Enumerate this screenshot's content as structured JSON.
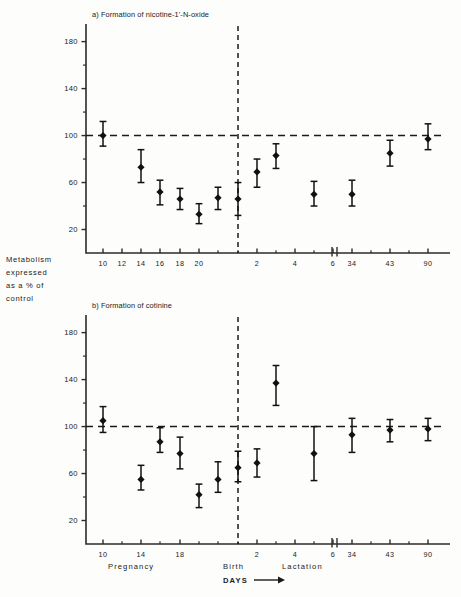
{
  "figure": {
    "y_axis_label_lines": [
      "Metabolism",
      "expressed",
      "as  a % of",
      "control"
    ],
    "y_axis_label_text": "Metabolism expressed as a % of control",
    "phase_labels": {
      "pregnancy": "Pregnancy",
      "birth": "Birth",
      "lactation": "Lactation",
      "days": "DAYS",
      "arrow": "⟶"
    },
    "colors": {
      "ink": "#1a1a1a",
      "marker": "#111111",
      "axis": "#2b2b2b",
      "background": "#fdfdfb"
    }
  },
  "chart_data": [
    {
      "type": "scatter",
      "panel": "a",
      "title": "a) Formation of nicotine-1'-N-oxide",
      "xlabel": "DAYS",
      "ylabel": "Metabolism expressed as a % of control",
      "ylim": [
        0,
        195
      ],
      "yticks": [
        20,
        60,
        100,
        140,
        180
      ],
      "yticks_minor": [
        40,
        80,
        120,
        160
      ],
      "grid": false,
      "reference_line": 100,
      "birth_marker": "Birth",
      "axis_break": true,
      "xticks": [
        "10",
        "12",
        "14",
        "16",
        "18",
        "20",
        "2",
        "4",
        "6",
        "34",
        "43",
        "90"
      ],
      "error_type": "range",
      "points": [
        {
          "label": "10",
          "phase": "pregnancy",
          "value": 100,
          "low": 91,
          "high": 112
        },
        {
          "label": "14",
          "phase": "pregnancy",
          "value": 73,
          "low": 60,
          "high": 88
        },
        {
          "label": "16",
          "phase": "pregnancy",
          "value": 52,
          "low": 41,
          "high": 62
        },
        {
          "label": "18",
          "phase": "pregnancy",
          "value": 46,
          "low": 37,
          "high": 55
        },
        {
          "label": "20",
          "phase": "pregnancy",
          "value": 33,
          "low": 25,
          "high": 42
        },
        {
          "label": "21",
          "phase": "pregnancy",
          "value": 47,
          "low": 37,
          "high": 56
        },
        {
          "label": "1",
          "phase": "lactation",
          "value": 46,
          "low": 32,
          "high": 60
        },
        {
          "label": "2",
          "phase": "lactation",
          "value": 69,
          "low": 56,
          "high": 80
        },
        {
          "label": "3",
          "phase": "lactation",
          "value": 83,
          "low": 72,
          "high": 93
        },
        {
          "label": "5",
          "phase": "lactation",
          "value": 50,
          "low": 40,
          "high": 61
        },
        {
          "label": "34",
          "phase": "lactation",
          "value": 50,
          "low": 40,
          "high": 62
        },
        {
          "label": "43",
          "phase": "lactation",
          "value": 85,
          "low": 74,
          "high": 96
        },
        {
          "label": "90",
          "phase": "lactation",
          "value": 97,
          "low": 88,
          "high": 110
        }
      ]
    },
    {
      "type": "scatter",
      "panel": "b",
      "title": "b) Formation of cotinine",
      "xlabel": "DAYS",
      "ylabel": "Metabolism expressed as a % of control",
      "ylim": [
        0,
        195
      ],
      "yticks": [
        20,
        60,
        100,
        140,
        180
      ],
      "yticks_minor": [
        40,
        80,
        120,
        160
      ],
      "grid": false,
      "reference_line": 100,
      "birth_marker": "Birth",
      "axis_break": true,
      "xticks": [
        "10",
        "14",
        "18",
        "2",
        "4",
        "6",
        "34",
        "43",
        "90"
      ],
      "error_type": "range",
      "points": [
        {
          "label": "10",
          "phase": "pregnancy",
          "value": 105,
          "low": 95,
          "high": 117
        },
        {
          "label": "14",
          "phase": "pregnancy",
          "value": 55,
          "low": 46,
          "high": 67
        },
        {
          "label": "16",
          "phase": "pregnancy",
          "value": 87,
          "low": 78,
          "high": 99
        },
        {
          "label": "18",
          "phase": "pregnancy",
          "value": 77,
          "low": 64,
          "high": 91
        },
        {
          "label": "20",
          "phase": "pregnancy",
          "value": 42,
          "low": 31,
          "high": 51
        },
        {
          "label": "21",
          "phase": "pregnancy",
          "value": 55,
          "low": 44,
          "high": 70
        },
        {
          "label": "1",
          "phase": "lactation",
          "value": 65,
          "low": 53,
          "high": 79
        },
        {
          "label": "2",
          "phase": "lactation",
          "value": 69,
          "low": 57,
          "high": 81
        },
        {
          "label": "3",
          "phase": "lactation",
          "value": 137,
          "low": 118,
          "high": 152
        },
        {
          "label": "5",
          "phase": "lactation",
          "value": 77,
          "low": 54,
          "high": 100
        },
        {
          "label": "34",
          "phase": "lactation",
          "value": 93,
          "low": 78,
          "high": 107
        },
        {
          "label": "43",
          "phase": "lactation",
          "value": 97,
          "low": 87,
          "high": 106
        },
        {
          "label": "90",
          "phase": "lactation",
          "value": 98,
          "low": 88,
          "high": 107
        }
      ]
    }
  ]
}
